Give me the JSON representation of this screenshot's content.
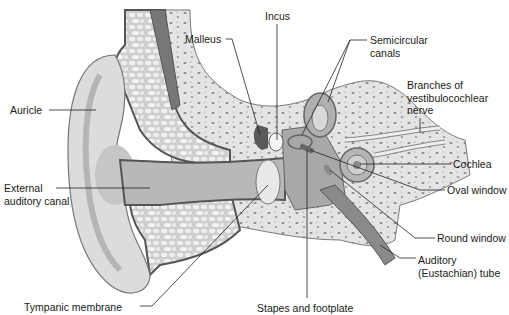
{
  "diagram": {
    "labels": [
      {
        "id": "auricle",
        "text": "Auricle",
        "x": 10,
        "y": 104
      },
      {
        "id": "external-auditory-canal",
        "text": "External\nauditory canal",
        "x": 4,
        "y": 182
      },
      {
        "id": "tympanic-membrane",
        "text": "Tympanic membrane",
        "x": 24,
        "y": 301
      },
      {
        "id": "malleus",
        "text": "Malleus",
        "x": 185,
        "y": 33
      },
      {
        "id": "incus",
        "text": "Incus",
        "x": 265,
        "y": 10
      },
      {
        "id": "semicircular-canals",
        "text": "Semicircular\ncanals",
        "x": 370,
        "y": 34
      },
      {
        "id": "vestibulocochlear-nerve",
        "text": "Branches of\nvestibulocochlear\nnerve",
        "x": 407,
        "y": 79
      },
      {
        "id": "cochlea",
        "text": "Cochlea",
        "x": 453,
        "y": 158
      },
      {
        "id": "oval-window",
        "text": "Oval window",
        "x": 447,
        "y": 184
      },
      {
        "id": "round-window",
        "text": "Round window",
        "x": 437,
        "y": 232
      },
      {
        "id": "auditory-tube",
        "text": "Auditory\n(Eustachian) tube",
        "x": 418,
        "y": 254
      },
      {
        "id": "stapes-footplate",
        "text": "Stapes and footplate",
        "x": 257,
        "y": 302
      }
    ]
  }
}
